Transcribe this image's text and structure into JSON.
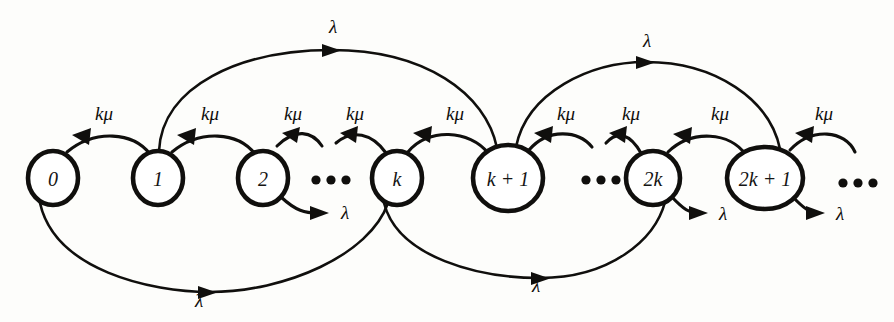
{
  "figure": {
    "kind": "state-transition-diagram",
    "title": "",
    "ink_color": "#100f0d",
    "background_color": "#fdfdfb"
  },
  "states": [
    {
      "id": "s0",
      "label": "0",
      "x": 53,
      "y": 178,
      "rx": 25,
      "ry": 27
    },
    {
      "id": "s1",
      "label": "1",
      "x": 158,
      "y": 178,
      "rx": 25,
      "ry": 27
    },
    {
      "id": "s2",
      "label": "2",
      "x": 263,
      "y": 178,
      "rx": 25,
      "ry": 27
    },
    {
      "id": "sk",
      "label": "k",
      "x": 397,
      "y": 178,
      "rx": 25,
      "ry": 27
    },
    {
      "id": "skp1",
      "label": "k + 1",
      "x": 508,
      "y": 178,
      "rx": 35,
      "ry": 33
    },
    {
      "id": "s2k",
      "label": "2k",
      "x": 653,
      "y": 178,
      "rx": 27,
      "ry": 27
    },
    {
      "id": "s2kp1",
      "label": "2k + 1",
      "x": 765,
      "y": 178,
      "rx": 38,
      "ry": 31
    }
  ],
  "ellipses": [
    {
      "id": "e1",
      "x": 330,
      "y": 180,
      "count": 3
    },
    {
      "id": "e2",
      "x": 600,
      "y": 180,
      "count": 3
    },
    {
      "id": "e3",
      "x": 857,
      "y": 183,
      "count": 3
    }
  ],
  "service_rate": {
    "symbol": "kμ",
    "direction": "leftward",
    "description": "service-rate transitions from state n to state n-1",
    "labels": [
      {
        "id": "mu1",
        "text": "kμ",
        "x": 104,
        "y": 113,
        "from": "s1",
        "to": "s0"
      },
      {
        "id": "mu2",
        "text": "kμ",
        "x": 210,
        "y": 113,
        "from": "s2",
        "to": "s1"
      },
      {
        "id": "mu3",
        "text": "kμ",
        "x": 293,
        "y": 113,
        "from": "dots1",
        "to": "s2"
      },
      {
        "id": "mu4",
        "text": "kμ",
        "x": 355,
        "y": 113,
        "from": "sk",
        "to": "dots1"
      },
      {
        "id": "mu5",
        "text": "kμ",
        "x": 455,
        "y": 113,
        "from": "skp1",
        "to": "sk"
      },
      {
        "id": "mu6",
        "text": "kμ",
        "x": 566,
        "y": 113,
        "from": "dots2",
        "to": "skp1"
      },
      {
        "id": "mu7",
        "text": "kμ",
        "x": 631,
        "y": 113,
        "from": "s2k",
        "to": "dots2"
      },
      {
        "id": "mu8",
        "text": "kμ",
        "x": 720,
        "y": 113,
        "from": "s2kp1",
        "to": "s2k"
      },
      {
        "id": "mu9",
        "text": "kμ",
        "x": 824,
        "y": 113,
        "from": "dots3",
        "to": "s2kp1"
      }
    ]
  },
  "arrival_rate": {
    "symbol": "λ",
    "description": "arrival-rate transitions jumping k states ahead",
    "top_arcs": [
      {
        "id": "lam_top1",
        "text": "λ",
        "x": 333,
        "y": 26,
        "from": "s1",
        "to": "skp1"
      },
      {
        "id": "lam_top2",
        "text": "λ",
        "x": 644,
        "y": 40,
        "from": "skp1",
        "to": "s2kp1"
      }
    ],
    "bottom_arcs": [
      {
        "id": "lam_bot1",
        "text": "λ",
        "x": 199,
        "y": 298,
        "from": "s0",
        "to": "sk"
      },
      {
        "id": "lam_bot2",
        "text": "λ",
        "x": 533,
        "y": 283,
        "from": "sk",
        "to": "s2k"
      }
    ],
    "stub_arrows": [
      {
        "id": "lam_stub1",
        "text": "λ",
        "x": 344,
        "y": 212,
        "from": "s2"
      },
      {
        "id": "lam_stub2",
        "text": "λ",
        "x": 722,
        "y": 213,
        "from": "s2k"
      },
      {
        "id": "lam_stub3",
        "text": "λ",
        "x": 838,
        "y": 213,
        "from": "s2kp1"
      }
    ]
  }
}
